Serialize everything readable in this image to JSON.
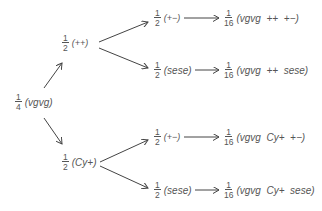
{
  "diagram": {
    "type": "probability-tree",
    "root": {
      "num": "1",
      "den": "4",
      "genotype": "(vgvg)"
    },
    "level1": [
      {
        "num": "1",
        "den": "2",
        "genotype": "(++)"
      },
      {
        "num": "1",
        "den": "2",
        "genotype": "(Cy+)"
      }
    ],
    "level2": [
      {
        "num": "1",
        "den": "2",
        "genotype": "(+−)"
      },
      {
        "num": "1",
        "den": "2",
        "genotype": "(sese)"
      },
      {
        "num": "1",
        "den": "2",
        "genotype": "(+−)"
      },
      {
        "num": "1",
        "den": "2",
        "genotype": "(sese)"
      }
    ],
    "results": [
      {
        "num": "1",
        "den": "16",
        "genotype": "(vgvg  ++  +−)"
      },
      {
        "num": "1",
        "den": "16",
        "genotype": "(vgvg  ++  sese)"
      },
      {
        "num": "1",
        "den": "16",
        "genotype": "(vgvg  Cy+  +−)"
      },
      {
        "num": "1",
        "den": "16",
        "genotype": "(vgvg  Cy+  sese)"
      }
    ]
  }
}
